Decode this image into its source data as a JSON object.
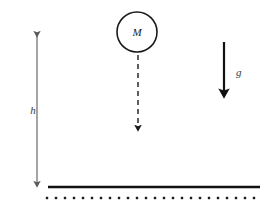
{
  "figure": {
    "background_color": "#ffffff",
    "width": 272,
    "height": 213
  },
  "mass": {
    "label": "M",
    "shape": "circle",
    "center_x": 137,
    "center_y": 32,
    "radius": 20,
    "stroke_color": "#1a1a1a",
    "stroke_width": 1.6,
    "fill_color": "#ffffff"
  },
  "fall_arrow": {
    "label": "",
    "style": "dashed",
    "x": 138,
    "y_start": 55,
    "y_end": 133,
    "color": "#1a1a1a",
    "dash_pattern": "5,4",
    "stroke_width": 1.4
  },
  "height_measure": {
    "label": "h",
    "x": 37,
    "y_top": 30,
    "y_bottom": 188,
    "label_x": 33,
    "label_y": 114,
    "color": "#5a5a5a",
    "stroke_width": 1.1,
    "arrowheads": "both"
  },
  "gravity_vector": {
    "label": "g",
    "x": 224,
    "y_start": 42,
    "y_end": 100,
    "label_x": 236,
    "label_y": 76,
    "color": "#111111",
    "stroke_width": 2.2,
    "arrowheads": "end"
  },
  "ground": {
    "line": {
      "y": 187,
      "x_start": 48,
      "x_end": 260,
      "color": "#111111",
      "stroke_width": 2.6
    },
    "hatching": {
      "y": 198,
      "x_start": 47,
      "x_end": 257,
      "dot_spacing": 9,
      "dot_size": 2.4,
      "dot_count": 24,
      "color": "#1a1a1a"
    }
  }
}
